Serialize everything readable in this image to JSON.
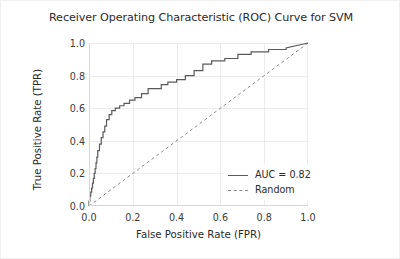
{
  "chart_data": {
    "type": "line",
    "title": "Receiver Operating Characteristic (ROC) Curve for SVM",
    "xlabel": "False Positive Rate (FPR)",
    "ylabel": "True Positive Rate (TPR)",
    "xlim": [
      0.0,
      1.0
    ],
    "ylim": [
      0.0,
      1.0
    ],
    "grid": true,
    "legend_position": "lower right",
    "xticks": [
      "0.0",
      "0.2",
      "0.4",
      "0.6",
      "0.8",
      "1.0"
    ],
    "xtick_values": [
      0.0,
      0.2,
      0.4,
      0.6,
      0.8,
      1.0
    ],
    "yticks": [
      "0.0",
      "0.2",
      "0.4",
      "0.6",
      "0.8",
      "1.0"
    ],
    "ytick_values": [
      0.0,
      0.2,
      0.4,
      0.6,
      0.8,
      1.0
    ],
    "auc": 0.82,
    "series": [
      {
        "name": "AUC = 0.82",
        "style": "solid",
        "color": "#5a5a5a",
        "drawstyle": "steps-post",
        "x": [
          0.0,
          0.0,
          0.004,
          0.004,
          0.008,
          0.008,
          0.012,
          0.012,
          0.016,
          0.016,
          0.02,
          0.02,
          0.024,
          0.024,
          0.028,
          0.028,
          0.032,
          0.032,
          0.036,
          0.036,
          0.04,
          0.04,
          0.048,
          0.048,
          0.056,
          0.056,
          0.064,
          0.064,
          0.072,
          0.072,
          0.08,
          0.08,
          0.092,
          0.092,
          0.104,
          0.104,
          0.12,
          0.12,
          0.14,
          0.14,
          0.16,
          0.16,
          0.185,
          0.185,
          0.21,
          0.21,
          0.24,
          0.24,
          0.27,
          0.27,
          0.3,
          0.3,
          0.33,
          0.33,
          0.36,
          0.36,
          0.4,
          0.4,
          0.44,
          0.44,
          0.48,
          0.48,
          0.52,
          0.52,
          0.56,
          0.56,
          0.62,
          0.62,
          0.68,
          0.68,
          0.74,
          0.74,
          0.82,
          0.82,
          0.9,
          0.9,
          1.0
        ],
        "y": [
          0.0,
          0.03,
          0.03,
          0.06,
          0.06,
          0.085,
          0.085,
          0.11,
          0.11,
          0.14,
          0.14,
          0.17,
          0.17,
          0.2,
          0.2,
          0.23,
          0.23,
          0.265,
          0.265,
          0.3,
          0.3,
          0.34,
          0.34,
          0.38,
          0.38,
          0.42,
          0.42,
          0.455,
          0.455,
          0.49,
          0.49,
          0.53,
          0.53,
          0.56,
          0.56,
          0.585,
          0.585,
          0.6,
          0.6,
          0.615,
          0.615,
          0.63,
          0.63,
          0.65,
          0.65,
          0.665,
          0.665,
          0.69,
          0.69,
          0.72,
          0.72,
          0.72,
          0.72,
          0.745,
          0.745,
          0.76,
          0.76,
          0.775,
          0.775,
          0.8,
          0.8,
          0.83,
          0.83,
          0.87,
          0.87,
          0.89,
          0.89,
          0.905,
          0.905,
          0.93,
          0.93,
          0.945,
          0.945,
          0.96,
          0.96,
          0.97,
          1.0
        ]
      },
      {
        "name": "Random",
        "style": "dashed",
        "color": "#8a8a8a",
        "x": [
          0.0,
          1.0
        ],
        "y": [
          0.0,
          1.0
        ]
      }
    ]
  },
  "legend": {
    "items": [
      {
        "label": "AUC = 0.82",
        "style": "solid"
      },
      {
        "label": "Random",
        "style": "dashed"
      }
    ]
  }
}
